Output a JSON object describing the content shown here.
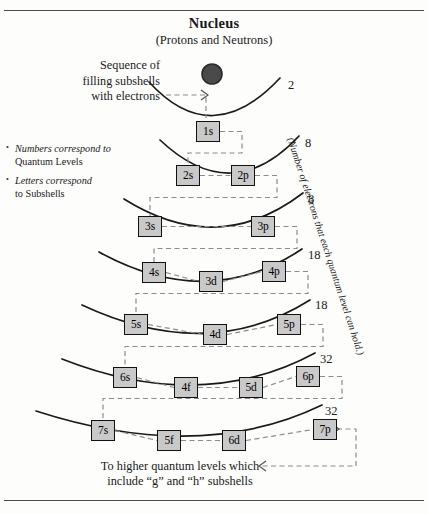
{
  "figure": {
    "title": "Nucleus",
    "subtitle": "(Protons and Neutrons)",
    "sequence_note": "Sequence of\nfilling subshells\nwith electrons",
    "bottom_note": "To higher quantum levels which\ninclude “g” and “h” subshells",
    "capacity_caption": "(Number of electrons that each quantum level can hold.)",
    "bullets": [
      {
        "italic": "Numbers correspond to",
        "plain": "Quantum Levels"
      },
      {
        "italic": "Letters correspond",
        "plain": "to Subshells"
      }
    ]
  },
  "colors": {
    "box_fill": "#c9c9c9",
    "box_stroke": "#111111",
    "arc_stroke": "#1a1a1a",
    "dashed_stroke": "#8c8c8c",
    "nucleus_fill": "#4a4a4a",
    "nucleus_stroke": "#2b2b2b",
    "rule": "#4a4a4a"
  },
  "nucleus": {
    "cx": 212,
    "cy": 74,
    "r": 10
  },
  "shells": [
    {
      "level": 1,
      "capacity": "2",
      "capacity_pos": {
        "x": 288,
        "y": 78
      },
      "arc": {
        "x1": 149,
        "y1": 82,
        "cx": 212,
        "cy": 151,
        "x2": 280,
        "y2": 78
      },
      "subshells": [
        {
          "label": "1s",
          "x": 196,
          "y": 121,
          "w": 24,
          "h": 21
        }
      ]
    },
    {
      "level": 2,
      "capacity": "8",
      "capacity_pos": {
        "x": 305,
        "y": 136
      },
      "arc": {
        "x1": 160,
        "y1": 140,
        "cx": 232,
        "cy": 208,
        "x2": 299,
        "y2": 136
      },
      "subshells": [
        {
          "label": "2s",
          "x": 176,
          "y": 165,
          "w": 24,
          "h": 21
        },
        {
          "label": "2p",
          "x": 231,
          "y": 165,
          "w": 24,
          "h": 21
        }
      ]
    },
    {
      "level": 3,
      "capacity": "8",
      "capacity_pos": {
        "x": 308,
        "y": 192
      },
      "arc": {
        "x1": 124,
        "y1": 199,
        "cx": 218,
        "cy": 258,
        "x2": 303,
        "y2": 193
      },
      "subshells": [
        {
          "label": "3s",
          "x": 138,
          "y": 216,
          "w": 24,
          "h": 21
        },
        {
          "label": "3p",
          "x": 251,
          "y": 216,
          "w": 24,
          "h": 21
        }
      ]
    },
    {
      "level": 4,
      "capacity": "18",
      "capacity_pos": {
        "x": 308,
        "y": 248
      },
      "arc": {
        "x1": 99,
        "y1": 252,
        "cx": 208,
        "cy": 312,
        "x2": 302,
        "y2": 249
      },
      "subshells": [
        {
          "label": "4s",
          "x": 142,
          "y": 262,
          "w": 24,
          "h": 21
        },
        {
          "label": "3d",
          "x": 199,
          "y": 271,
          "w": 24,
          "h": 21
        },
        {
          "label": "4p",
          "x": 262,
          "y": 261,
          "w": 24,
          "h": 21
        }
      ]
    },
    {
      "level": 5,
      "capacity": "18",
      "capacity_pos": {
        "x": 315,
        "y": 298
      },
      "arc": {
        "x1": 82,
        "y1": 305,
        "cx": 208,
        "cy": 364,
        "x2": 310,
        "y2": 300
      },
      "subshells": [
        {
          "label": "5s",
          "x": 124,
          "y": 314,
          "w": 24,
          "h": 21
        },
        {
          "label": "4d",
          "x": 203,
          "y": 324,
          "w": 24,
          "h": 21
        },
        {
          "label": "5p",
          "x": 277,
          "y": 314,
          "w": 24,
          "h": 21
        }
      ]
    },
    {
      "level": 6,
      "capacity": "32",
      "capacity_pos": {
        "x": 320,
        "y": 352
      },
      "arc": {
        "x1": 62,
        "y1": 359,
        "cx": 202,
        "cy": 414,
        "x2": 315,
        "y2": 353
      },
      "subshells": [
        {
          "label": "6s",
          "x": 113,
          "y": 367,
          "w": 24,
          "h": 21
        },
        {
          "label": "4f",
          "x": 174,
          "y": 377,
          "w": 24,
          "h": 21
        },
        {
          "label": "5d",
          "x": 239,
          "y": 377,
          "w": 24,
          "h": 21
        },
        {
          "label": "6p",
          "x": 296,
          "y": 366,
          "w": 24,
          "h": 21
        }
      ]
    },
    {
      "level": 7,
      "capacity": "32",
      "capacity_pos": {
        "x": 325,
        "y": 404
      },
      "arc": {
        "x1": 36,
        "y1": 411,
        "cx": 200,
        "cy": 464,
        "x2": 322,
        "y2": 405
      },
      "subshells": [
        {
          "label": "7s",
          "x": 91,
          "y": 420,
          "w": 24,
          "h": 21
        },
        {
          "label": "5f",
          "x": 157,
          "y": 430,
          "w": 24,
          "h": 21
        },
        {
          "label": "6d",
          "x": 222,
          "y": 430,
          "w": 24,
          "h": 21
        },
        {
          "label": "7p",
          "x": 313,
          "y": 419,
          "w": 24,
          "h": 21
        }
      ]
    }
  ]
}
